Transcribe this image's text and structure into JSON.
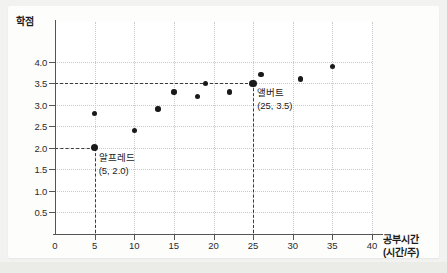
{
  "chart_data": {
    "type": "scatter",
    "title": "",
    "xlabel": "공부시간",
    "xlabel_unit": "(시간/주)",
    "ylabel": "학점",
    "xlim": [
      0,
      40
    ],
    "ylim": [
      0,
      4.25
    ],
    "xticks": [
      0,
      5,
      10,
      15,
      20,
      25,
      30,
      35,
      40
    ],
    "xtick_labels": [
      "0",
      "5",
      "10",
      "15",
      "20",
      "25",
      "30",
      "35",
      "40"
    ],
    "yticks": [
      0.5,
      1.0,
      1.5,
      2.0,
      2.5,
      3.0,
      3.5,
      4.0
    ],
    "ytick_labels": [
      "0.5",
      "1.0",
      "1.5",
      "2.0",
      "2.5",
      "3.0",
      "3.5",
      "4.0"
    ],
    "grid": true,
    "legend": "none",
    "points": [
      {
        "x": 5,
        "y": 2.0,
        "emphasis": true
      },
      {
        "x": 5,
        "y": 2.8,
        "emphasis": false
      },
      {
        "x": 10,
        "y": 2.4,
        "emphasis": false
      },
      {
        "x": 13,
        "y": 2.9,
        "emphasis": false
      },
      {
        "x": 15,
        "y": 3.3,
        "emphasis": false
      },
      {
        "x": 18,
        "y": 3.2,
        "emphasis": false
      },
      {
        "x": 19,
        "y": 3.5,
        "emphasis": false
      },
      {
        "x": 22,
        "y": 3.3,
        "emphasis": false
      },
      {
        "x": 25,
        "y": 3.5,
        "emphasis": true
      },
      {
        "x": 26,
        "y": 3.7,
        "emphasis": false
      },
      {
        "x": 31,
        "y": 3.6,
        "emphasis": false
      },
      {
        "x": 35,
        "y": 3.9,
        "emphasis": false
      }
    ],
    "annotations": [
      {
        "name": "알프레드",
        "coord_label": "(5, 2.0)",
        "x": 5,
        "y": 2.0
      },
      {
        "name": "앨버트",
        "coord_label": "(25, 3.5)",
        "x": 25,
        "y": 3.5
      }
    ],
    "guide_lines": [
      {
        "orientation": "vertical",
        "x": 5,
        "from_y": 0,
        "to_y": 2.0
      },
      {
        "orientation": "horizontal",
        "y": 2.0,
        "from_x": 0,
        "to_x": 5
      },
      {
        "orientation": "vertical",
        "x": 25,
        "from_y": 0,
        "to_y": 3.5
      },
      {
        "orientation": "horizontal",
        "y": 3.5,
        "from_x": 0,
        "to_x": 25
      }
    ],
    "colors": {
      "point": "#1a1a1a",
      "axis": "#555555",
      "grid": "#c9c9c9",
      "guide": "#3a3a3a",
      "plot_background": "#ffffff",
      "page_background": "#f2f2f0"
    }
  }
}
